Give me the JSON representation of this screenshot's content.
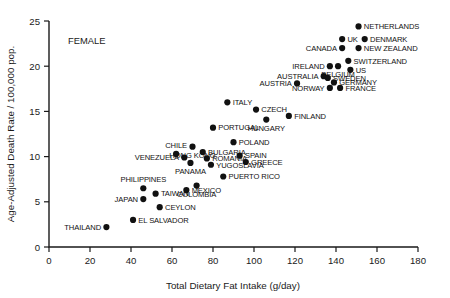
{
  "chart_data": {
    "type": "scatter",
    "title": "",
    "annotation": "FEMALE",
    "xlabel": "Total Dietary Fat Intake (g/day)",
    "ylabel": "Age-Adjusted Death Rate / 100,000 pop.",
    "xlim": [
      0,
      180
    ],
    "ylim": [
      0,
      25
    ],
    "xticks": [
      0,
      20,
      40,
      60,
      80,
      100,
      120,
      140,
      160,
      180
    ],
    "yticks": [
      0,
      5,
      10,
      15,
      20,
      25
    ],
    "grid": false,
    "legend": "none",
    "points": [
      {
        "label": "NETHERLANDS",
        "x": 151,
        "y": 24.4,
        "anchor": "right"
      },
      {
        "label": "UK",
        "x": 143,
        "y": 23.0,
        "anchor": "right"
      },
      {
        "label": "DENMARK",
        "x": 154,
        "y": 23.0,
        "anchor": "right"
      },
      {
        "label": "CANADA",
        "x": 143,
        "y": 22.0,
        "anchor": "left"
      },
      {
        "label": "NEW ZEALAND",
        "x": 151,
        "y": 22.0,
        "anchor": "right"
      },
      {
        "label": "SWITZERLAND",
        "x": 146,
        "y": 20.6,
        "anchor": "right"
      },
      {
        "label": "IRELAND",
        "x": 137,
        "y": 20.0,
        "anchor": "left"
      },
      {
        "label": "BELGIUM",
        "x": 141,
        "y": 20.0,
        "anchor": "below"
      },
      {
        "label": "US",
        "x": 147,
        "y": 19.6,
        "anchor": "right"
      },
      {
        "label": "AUSTRALIA",
        "x": 134,
        "y": 18.9,
        "anchor": "left"
      },
      {
        "label": "SWEDEN",
        "x": 136,
        "y": 18.7,
        "anchor": "right"
      },
      {
        "label": "AUSTRIA",
        "x": 121,
        "y": 18.1,
        "anchor": "left"
      },
      {
        "label": "GERMANY",
        "x": 139,
        "y": 18.2,
        "anchor": "right"
      },
      {
        "label": "NORWAY",
        "x": 137,
        "y": 17.6,
        "anchor": "left"
      },
      {
        "label": "FRANCE",
        "x": 142,
        "y": 17.6,
        "anchor": "right"
      },
      {
        "label": "ITALY",
        "x": 87,
        "y": 16.0,
        "anchor": "right"
      },
      {
        "label": "CZECH",
        "x": 101,
        "y": 15.2,
        "anchor": "right"
      },
      {
        "label": "FINLAND",
        "x": 117,
        "y": 14.5,
        "anchor": "right"
      },
      {
        "label": "HUNGARY",
        "x": 106,
        "y": 14.1,
        "anchor": "below"
      },
      {
        "label": "PORTUGAL",
        "x": 80,
        "y": 13.2,
        "anchor": "right"
      },
      {
        "label": "POLAND",
        "x": 90,
        "y": 11.6,
        "anchor": "right"
      },
      {
        "label": "HONG KONG",
        "x": 70,
        "y": 11.1,
        "anchor": "below"
      },
      {
        "label": "CHILE",
        "x": 62,
        "y": 10.3,
        "anchor": "above"
      },
      {
        "label": "BULGARIA",
        "x": 75,
        "y": 10.5,
        "anchor": "right"
      },
      {
        "label": "SPAIN",
        "x": 93,
        "y": 10.1,
        "anchor": "right"
      },
      {
        "label": "VENEZUELA",
        "x": 66,
        "y": 9.9,
        "anchor": "left"
      },
      {
        "label": "ROMANIA",
        "x": 77,
        "y": 9.8,
        "anchor": "right"
      },
      {
        "label": "GREECE",
        "x": 96,
        "y": 9.4,
        "anchor": "right"
      },
      {
        "label": "PANAMA",
        "x": 69,
        "y": 9.3,
        "anchor": "below"
      },
      {
        "label": "YUGOSLAVIA",
        "x": 79,
        "y": 9.1,
        "anchor": "right"
      },
      {
        "label": "PUERTO RICO",
        "x": 85,
        "y": 7.8,
        "anchor": "right"
      },
      {
        "label": "COLOMBIA",
        "x": 72,
        "y": 6.8,
        "anchor": "below"
      },
      {
        "label": "PHILIPPINES",
        "x": 46,
        "y": 6.5,
        "anchor": "above"
      },
      {
        "label": "MEXICO",
        "x": 67,
        "y": 6.3,
        "anchor": "right"
      },
      {
        "label": "TAIWAN",
        "x": 52,
        "y": 5.9,
        "anchor": "right"
      },
      {
        "label": "JAWAN_SPACER",
        "x": 0,
        "y": 0,
        "anchor": "hidden"
      },
      {
        "label": "JAPAN",
        "x": 46,
        "y": 5.3,
        "anchor": "left"
      },
      {
        "label": "CEYLON",
        "x": 54,
        "y": 4.4,
        "anchor": "right"
      },
      {
        "label": "EL SALVADOR",
        "x": 41,
        "y": 3.0,
        "anchor": "right"
      },
      {
        "label": "THAILAND",
        "x": 28,
        "y": 2.2,
        "anchor": "left"
      }
    ]
  },
  "axes": {
    "x_tick_labels": [
      "0",
      "20",
      "40",
      "60",
      "80",
      "100",
      "120",
      "140",
      "160",
      "180"
    ],
    "y_tick_labels": [
      "0",
      "5",
      "10",
      "15",
      "20",
      "25"
    ],
    "x_axis_title": "Total Dietary Fat Intake (g/day)",
    "y_axis_title": "Age-Adjusted Death Rate / 100,000 pop.",
    "panel_annotation": "FEMALE"
  },
  "colors": {
    "marker": "#111111",
    "axis": "#1a1a1a",
    "background": "#ffffff"
  }
}
